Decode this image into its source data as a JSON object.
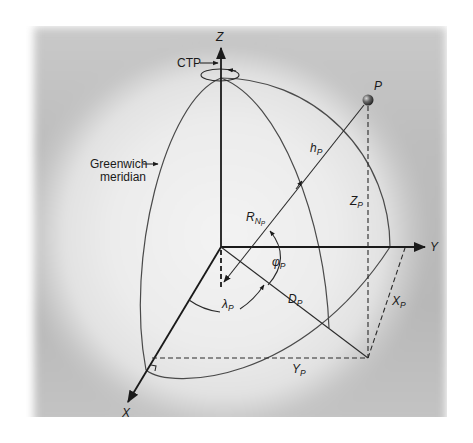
{
  "figure": {
    "axes": {
      "z": "Z",
      "y": "Y",
      "x": "X"
    },
    "callouts": {
      "ctp": "CTP",
      "greenwich_line1": "Greenwich",
      "greenwich_line2": "meridian"
    },
    "point": {
      "label": "P"
    },
    "quantities": {
      "height": {
        "main": "h",
        "sub": "P"
      },
      "z_coord": {
        "main": "Z",
        "sub": "P"
      },
      "radius_normal": {
        "main": "R",
        "sub": "N",
        "subsub": "P"
      },
      "latitude": {
        "main": "φ",
        "sub": "P"
      },
      "longitude": {
        "main": "λ",
        "sub": "P"
      },
      "distance": {
        "main": "D",
        "sub": "P"
      },
      "x_coord": {
        "main": "X",
        "sub": "P"
      },
      "y_coord": {
        "main": "Y",
        "sub": "P"
      }
    },
    "colors": {
      "line": "#1a1a1a",
      "curve": "#4a4a4a",
      "background_dark": "#b8b8b8",
      "globe_light": "#ececec"
    }
  }
}
